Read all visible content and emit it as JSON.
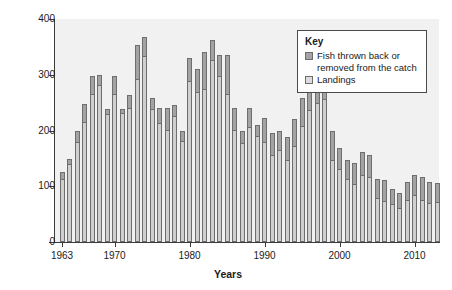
{
  "chart_data": {
    "type": "bar",
    "subtype": "stacked-vertical",
    "title": "",
    "xlabel": "Years",
    "ylabel": "Catches in 1,000 tonnes",
    "ylim": [
      0,
      400
    ],
    "yticks": [
      0,
      100,
      200,
      300,
      400
    ],
    "xticks": [
      1963,
      1970,
      1980,
      1990,
      2000,
      2010
    ],
    "xlim": [
      1962.4,
      2013.6
    ],
    "grid": false,
    "legend_position": "top-right",
    "categories": [
      1963,
      1964,
      1965,
      1966,
      1967,
      1968,
      1969,
      1970,
      1971,
      1972,
      1973,
      1974,
      1975,
      1976,
      1977,
      1978,
      1979,
      1980,
      1981,
      1982,
      1983,
      1984,
      1985,
      1986,
      1987,
      1988,
      1989,
      1990,
      1991,
      1992,
      1993,
      1994,
      1995,
      1996,
      1997,
      1998,
      1999,
      2000,
      2001,
      2002,
      2003,
      2004,
      2005,
      2006,
      2007,
      2008,
      2009,
      2010,
      2011,
      2012,
      2013
    ],
    "series": [
      {
        "name": "Landings",
        "color": "#cfcfcf",
        "values": [
          112,
          138,
          178,
          213,
          263,
          279,
          228,
          264,
          230,
          238,
          291,
          331,
          236,
          212,
          200,
          224,
          180,
          287,
          268,
          272,
          325,
          296,
          263,
          199,
          176,
          204,
          188,
          178,
          155,
          163,
          145,
          170,
          207,
          235,
          247,
          255,
          146,
          129,
          112,
          103,
          118,
          114,
          78,
          72,
          67,
          60,
          74,
          83,
          73,
          68,
          70
        ]
      },
      {
        "name": "Fish thrown back or removed from the catch",
        "color": "#a3a3a3",
        "values": [
          13,
          11,
          22,
          34,
          35,
          20,
          10,
          34,
          8,
          26,
          62,
          36,
          22,
          28,
          40,
          22,
          20,
          43,
          43,
          68,
          38,
          40,
          72,
          41,
          24,
          36,
          22,
          44,
          41,
          36,
          44,
          50,
          52,
          44,
          33,
          40,
          54,
          40,
          35,
          38,
          44,
          42,
          35,
          40,
          28,
          28,
          34,
          38,
          43,
          40,
          35
        ]
      }
    ],
    "totals": [
      125,
      149,
      200,
      247,
      298,
      299,
      238,
      298,
      238,
      264,
      353,
      367,
      258,
      240,
      240,
      246,
      200,
      330,
      311,
      340,
      363,
      336,
      335,
      240,
      200,
      240,
      210,
      222,
      196,
      199,
      189,
      220,
      259,
      279,
      280,
      295,
      200,
      169,
      147,
      141,
      162,
      156,
      113,
      112,
      95,
      88,
      108,
      121,
      116,
      108,
      105
    ]
  },
  "axes": {
    "y_title": "Catches in 1,000 tonnes",
    "x_title": "Years",
    "y_tick_labels": [
      "0",
      "100",
      "200",
      "300",
      "400"
    ],
    "x_tick_labels": [
      "1963",
      "1970",
      "1980",
      "1990",
      "2000",
      "2010"
    ]
  },
  "legend": {
    "title": "Key",
    "items": [
      {
        "label_line1": "Fish thrown back or",
        "label_line2": "removed from the catch",
        "swatch": "discards-swatch"
      },
      {
        "label_line1": "Landings",
        "label_line2": "",
        "swatch": "landings-swatch"
      }
    ]
  },
  "colors": {
    "plot_background": "#f1f1f1",
    "landings": "#cfcfcf",
    "discards": "#a3a3a3",
    "bar_border": "#6e6e6e",
    "axis": "#3b3b3b",
    "text": "#1a1a1a"
  }
}
